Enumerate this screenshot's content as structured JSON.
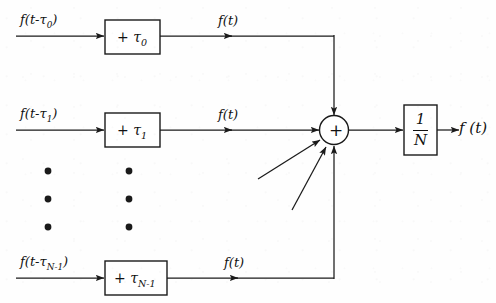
{
  "diagram": {
    "line_color": "#1a1a1a",
    "text_color": "#111111",
    "background_color": "#fefefe"
  },
  "branches": [
    {
      "id": "branch-0",
      "input_label": "f(t-τ",
      "input_sub": "0",
      "input_close": ")",
      "block_op": "+",
      "block_tau": "τ",
      "block_sub": "0",
      "output_label": "f(t)"
    },
    {
      "id": "branch-1",
      "input_label": "f(t-τ",
      "input_sub": "1",
      "input_close": ")",
      "block_op": "+",
      "block_tau": "τ",
      "block_sub": "1",
      "output_label": "f(t)"
    },
    {
      "id": "branch-n-1",
      "input_label": "f(t-τ",
      "input_sub": "N-1",
      "input_close": ")",
      "block_op": "+",
      "block_tau": "τ",
      "block_sub": "N-1",
      "output_label": "f(t)"
    }
  ],
  "ellipsis": {
    "label": "vertical-ellipsis",
    "dot_count_per_column": 3,
    "column_count": 2
  },
  "summing_junction": {
    "symbol": "+",
    "name": "summing-junction",
    "input_count": 5
  },
  "scaling_block": {
    "numerator": "1",
    "denominator": "N",
    "name": "one-over-n-block"
  },
  "output": {
    "label": "f (t)"
  }
}
